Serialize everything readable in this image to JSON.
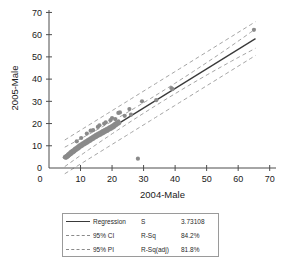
{
  "chart_data": {
    "type": "scatter",
    "title": "",
    "xlabel": "2004-Male",
    "ylabel": "2005-Male",
    "xlim": [
      0,
      72
    ],
    "ylim": [
      0,
      72
    ],
    "xticks": [
      0,
      10,
      20,
      30,
      40,
      50,
      60,
      70
    ],
    "yticks": [
      0,
      10,
      20,
      30,
      40,
      50,
      60,
      70
    ],
    "grid": false,
    "legend_position": "below-plot",
    "series": [
      {
        "name": "Data",
        "marker": "circle",
        "color": "#8a8a8a",
        "points": [
          [
            5.0,
            4.8
          ],
          [
            5.2,
            5.1
          ],
          [
            5.4,
            4.6
          ],
          [
            5.6,
            5.5
          ],
          [
            5.8,
            5.0
          ],
          [
            6.0,
            6.0
          ],
          [
            6.1,
            5.3
          ],
          [
            6.3,
            6.4
          ],
          [
            6.5,
            5.8
          ],
          [
            6.7,
            6.9
          ],
          [
            6.9,
            6.2
          ],
          [
            7.0,
            7.3
          ],
          [
            7.2,
            6.6
          ],
          [
            7.4,
            7.7
          ],
          [
            7.6,
            7.0
          ],
          [
            7.8,
            8.1
          ],
          [
            8.0,
            7.4
          ],
          [
            8.2,
            8.6
          ],
          [
            8.4,
            7.9
          ],
          [
            8.6,
            9.0
          ],
          [
            8.8,
            8.3
          ],
          [
            9.0,
            9.4
          ],
          [
            9.2,
            8.7
          ],
          [
            9.4,
            9.9
          ],
          [
            9.6,
            9.1
          ],
          [
            9.8,
            10.3
          ],
          [
            10.0,
            9.6
          ],
          [
            10.3,
            10.8
          ],
          [
            10.5,
            10.0
          ],
          [
            10.8,
            11.2
          ],
          [
            11.0,
            10.5
          ],
          [
            11.3,
            11.6
          ],
          [
            11.5,
            10.9
          ],
          [
            11.8,
            12.1
          ],
          [
            12.0,
            11.3
          ],
          [
            12.3,
            12.5
          ],
          [
            12.5,
            11.8
          ],
          [
            12.8,
            13.0
          ],
          [
            13.0,
            12.2
          ],
          [
            13.3,
            13.4
          ],
          [
            13.5,
            12.7
          ],
          [
            13.8,
            13.9
          ],
          [
            14.0,
            13.1
          ],
          [
            14.3,
            14.3
          ],
          [
            14.5,
            13.6
          ],
          [
            14.8,
            14.8
          ],
          [
            15.0,
            14.0
          ],
          [
            15.3,
            15.2
          ],
          [
            15.6,
            14.5
          ],
          [
            15.9,
            15.7
          ],
          [
            16.2,
            14.9
          ],
          [
            16.5,
            16.1
          ],
          [
            16.8,
            15.4
          ],
          [
            17.0,
            16.6
          ],
          [
            17.3,
            15.8
          ],
          [
            17.6,
            17.0
          ],
          [
            17.9,
            16.3
          ],
          [
            18.2,
            17.5
          ],
          [
            18.5,
            16.7
          ],
          [
            18.8,
            17.9
          ],
          [
            19.0,
            17.2
          ],
          [
            19.3,
            18.4
          ],
          [
            19.6,
            17.6
          ],
          [
            19.9,
            18.8
          ],
          [
            20.2,
            18.1
          ],
          [
            20.4,
            19.3
          ],
          [
            20.6,
            18.5
          ],
          [
            20.8,
            19.7
          ],
          [
            21.0,
            19.0
          ],
          [
            21.2,
            20.1
          ],
          [
            21.4,
            19.4
          ],
          [
            21.6,
            20.5
          ],
          [
            21.8,
            19.8
          ],
          [
            22.0,
            21.0
          ],
          [
            22.3,
            20.2
          ],
          [
            8.8,
            12.0
          ],
          [
            10.2,
            13.5
          ],
          [
            12.0,
            15.5
          ],
          [
            13.2,
            16.8
          ],
          [
            14.0,
            17.0
          ],
          [
            15.5,
            18.5
          ],
          [
            16.0,
            19.2
          ],
          [
            17.5,
            20.0
          ],
          [
            19.5,
            21.5
          ],
          [
            21.0,
            22.0
          ],
          [
            22.5,
            25.0
          ],
          [
            25.5,
            26.5
          ],
          [
            22.0,
            24.8
          ],
          [
            18.0,
            20.5
          ],
          [
            20.0,
            22.5
          ],
          [
            24.0,
            23.5
          ],
          [
            26.0,
            24.0
          ],
          [
            29.5,
            30.0
          ],
          [
            34.0,
            30.5
          ],
          [
            38.8,
            36.0
          ],
          [
            39.2,
            35.5
          ],
          [
            65.0,
            62.2
          ],
          [
            28.2,
            4.2
          ]
        ]
      }
    ],
    "fit": {
      "name": "Regression",
      "slope": 0.88,
      "intercept": 0.6,
      "x_start": 5.0,
      "x_end": 65.5
    },
    "ci_band": {
      "name": "95% CI",
      "lower_offset": -2.3,
      "upper_offset": 2.3
    },
    "pi_band": {
      "name": "95% PI",
      "lower_offset": -7.6,
      "upper_offset": 7.6
    }
  },
  "legend": {
    "rows": [
      {
        "swatch": "solid",
        "label": "Regression",
        "stat": "S",
        "value": "3.73108"
      },
      {
        "swatch": "dashed",
        "label": "95% CI",
        "stat": "R-Sq",
        "value": "84.2%"
      },
      {
        "swatch": "dashed",
        "label": "95% PI",
        "stat": "R-Sq(adj)",
        "value": "81.8%"
      }
    ]
  },
  "colors": {
    "point": "#8a8a8a",
    "regression": "#3a3a3a",
    "band": "#9a9a9a",
    "axis": "#4d4d4d"
  }
}
